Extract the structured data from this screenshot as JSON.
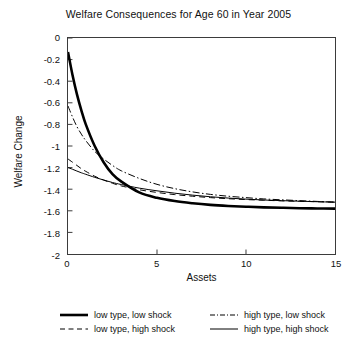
{
  "chart_data": {
    "type": "line",
    "title": "Welfare Consequences for Age 60 in Year 2005",
    "xlabel": "Assets",
    "ylabel": "Welfare Change",
    "xlim": [
      0,
      15
    ],
    "ylim": [
      -2,
      0
    ],
    "grid": false,
    "legend_position": "below-plot-two-columns",
    "xticks": [
      "0",
      "5",
      "10",
      "15"
    ],
    "xtick_values": [
      0,
      5,
      10,
      15
    ],
    "yticks": [
      "0",
      "-0.2",
      "-0.4",
      "-0.6",
      "-0.8",
      "-1",
      "-1.2",
      "-1.4",
      "-1.6",
      "-1.8",
      "-2"
    ],
    "ytick_values": [
      0,
      -0.2,
      -0.4,
      -0.6,
      -0.8,
      -1,
      -1.2,
      -1.4,
      -1.6,
      -1.8,
      -2
    ],
    "x": [
      0,
      0.25,
      0.5,
      0.75,
      1,
      1.5,
      2,
      2.5,
      3,
      4,
      5,
      6,
      7,
      8,
      9,
      10,
      11,
      12,
      13,
      14,
      15
    ],
    "series": [
      {
        "name": "low type, low shock",
        "style": "solid",
        "width": "thick",
        "color": "#000000",
        "values": [
          -0.13,
          -0.34,
          -0.52,
          -0.67,
          -0.8,
          -1.0,
          -1.15,
          -1.26,
          -1.33,
          -1.43,
          -1.48,
          -1.51,
          -1.53,
          -1.545,
          -1.555,
          -1.562,
          -1.568,
          -1.572,
          -1.576,
          -1.578,
          -1.58
        ]
      },
      {
        "name": "low type, high shock",
        "style": "dashed",
        "width": "thin",
        "color": "#000000",
        "values": [
          -1.12,
          -1.15,
          -1.18,
          -1.21,
          -1.235,
          -1.28,
          -1.315,
          -1.345,
          -1.37,
          -1.405,
          -1.43,
          -1.45,
          -1.465,
          -1.478,
          -1.488,
          -1.496,
          -1.502,
          -1.508,
          -1.512,
          -1.516,
          -1.52
        ]
      },
      {
        "name": "high type, low shock",
        "style": "dash-dot",
        "width": "thin",
        "color": "#000000",
        "values": [
          -0.63,
          -0.73,
          -0.82,
          -0.89,
          -0.95,
          -1.05,
          -1.12,
          -1.18,
          -1.23,
          -1.3,
          -1.355,
          -1.395,
          -1.425,
          -1.448,
          -1.465,
          -1.478,
          -1.49,
          -1.498,
          -1.506,
          -1.513,
          -1.52
        ]
      },
      {
        "name": "high type, high shock",
        "style": "solid",
        "width": "thin",
        "color": "#000000",
        "values": [
          -1.2,
          -1.215,
          -1.232,
          -1.248,
          -1.262,
          -1.29,
          -1.315,
          -1.338,
          -1.357,
          -1.39,
          -1.415,
          -1.437,
          -1.455,
          -1.47,
          -1.482,
          -1.492,
          -1.5,
          -1.506,
          -1.511,
          -1.516,
          -1.52
        ]
      }
    ]
  },
  "legend": {
    "entries": [
      {
        "label": "low type, low shock",
        "style": "solid-thick"
      },
      {
        "label": "low type, high shock",
        "style": "dashed"
      },
      {
        "label": "high type, low shock",
        "style": "dash-dot"
      },
      {
        "label": "high type, high shock",
        "style": "solid-thin"
      }
    ]
  }
}
